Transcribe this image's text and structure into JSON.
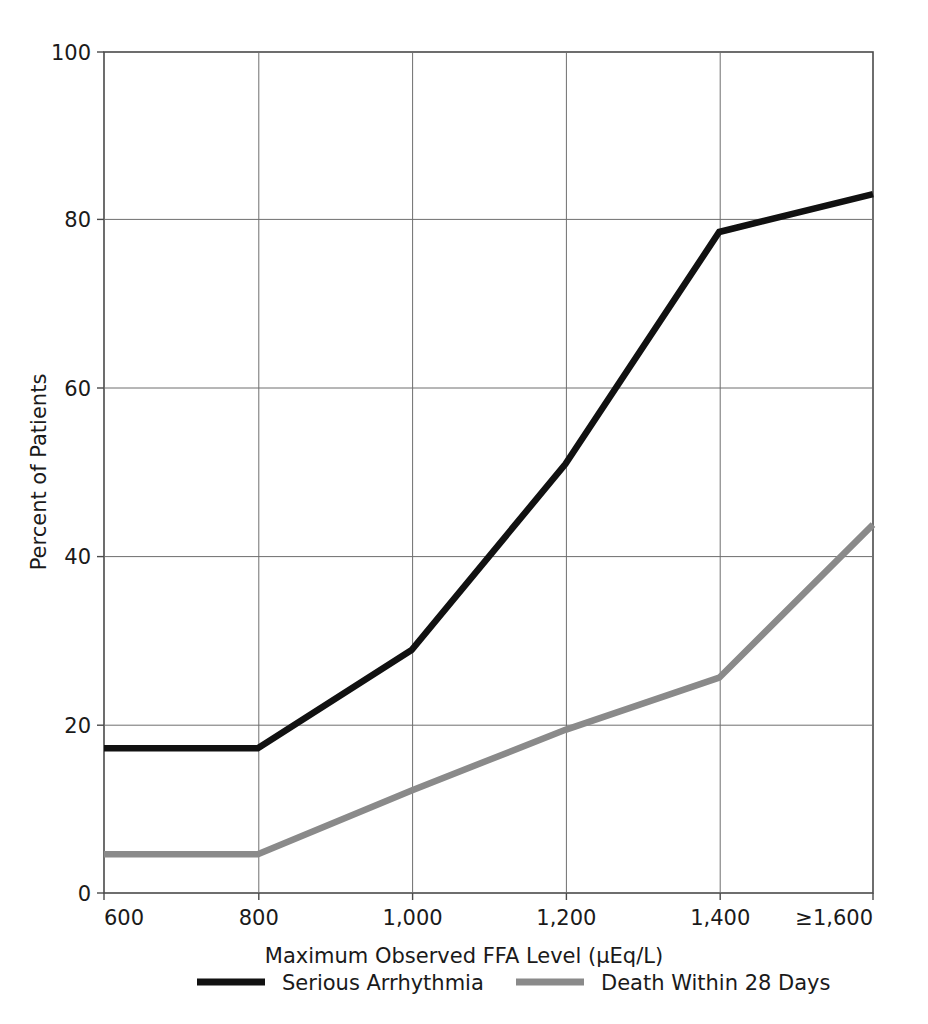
{
  "chart_data": {
    "type": "line",
    "title": "",
    "xlabel": "Maximum Observed FFA Level (μEq/L)",
    "ylabel": "Percent of Patients",
    "x": [
      600,
      800,
      1000,
      1200,
      1400,
      1600
    ],
    "categories": [
      "600",
      "800",
      "1,000",
      "1,200",
      "1,400",
      "≥1,600"
    ],
    "xtick_labels": [
      "600",
      "800",
      "1,000",
      "1,200",
      "1,400",
      "≥1,600"
    ],
    "ytick_labels": [
      "0",
      "20",
      "40",
      "60",
      "80",
      "100"
    ],
    "yticks": [
      0,
      20,
      40,
      60,
      80,
      100
    ],
    "ylim": [
      0,
      100
    ],
    "grid": true,
    "legend_position": "bottom",
    "series": [
      {
        "name": "Serious Arrhythmia",
        "color": "#111111",
        "values": [
          17.2,
          17.2,
          28.9,
          51.0,
          78.6,
          83.1
        ]
      },
      {
        "name": "Death Within 28 Days",
        "color": "#8a8a8a",
        "values": [
          4.6,
          4.6,
          12.2,
          19.4,
          25.6,
          43.8
        ]
      }
    ]
  },
  "axes": {
    "y_axis_title": "Percent of Patients",
    "x_axis_title": "Maximum Observed FFA Level (μEq/L)",
    "y_ticks": [
      {
        "label": "100",
        "value": 100
      },
      {
        "label": "80",
        "value": 80
      },
      {
        "label": "60",
        "value": 60
      },
      {
        "label": "40",
        "value": 40
      },
      {
        "label": "20",
        "value": 20
      },
      {
        "label": "0",
        "value": 0
      }
    ],
    "x_ticks": [
      {
        "label": "600",
        "value": 600
      },
      {
        "label": "800",
        "value": 800
      },
      {
        "label": "1,000",
        "value": 1000
      },
      {
        "label": "1,200",
        "value": 1200
      },
      {
        "label": "1,400",
        "value": 1400
      },
      {
        "label": "≥1,600",
        "value": 1600
      }
    ]
  },
  "legend": {
    "items": [
      {
        "label": "Serious Arrhythmia",
        "color": "#111111"
      },
      {
        "label": "Death Within 28 Days",
        "color": "#8a8a8a"
      }
    ]
  },
  "colors": {
    "series_arrhythmia": "#111111",
    "series_death": "#8a8a8a",
    "axis": "#4a4a4a",
    "grid": "#6e6e6e",
    "background": "#ffffff"
  }
}
